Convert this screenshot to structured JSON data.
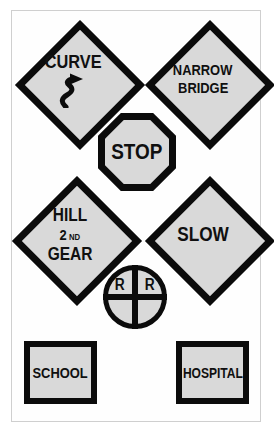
{
  "page": {
    "background_color": "#ffffff",
    "frame_color": "#cfcfcf"
  },
  "style": {
    "sign_face_color": "#d9d9d9",
    "sign_border_color": "#0b0b0b",
    "text_color": "#101010"
  },
  "signs": [
    {
      "id": "curve",
      "shape": "diamond",
      "lines": [
        "CURVE"
      ],
      "symbol": "curve-arrow-icon",
      "position": "top-left"
    },
    {
      "id": "narrow-bridge",
      "shape": "diamond",
      "lines": [
        "NARROW",
        "BRIDGE"
      ],
      "symbol": null,
      "position": "top-right"
    },
    {
      "id": "stop",
      "shape": "octagon",
      "lines": [
        "STOP"
      ],
      "symbol": null,
      "position": "upper-center"
    },
    {
      "id": "hill",
      "shape": "diamond",
      "lines": [
        "HILL",
        "2ND",
        "GEAR"
      ],
      "number": "2",
      "ordinal": "ND",
      "symbol": null,
      "position": "middle-left"
    },
    {
      "id": "slow",
      "shape": "diamond",
      "lines": [
        "SLOW"
      ],
      "symbol": null,
      "position": "middle-right"
    },
    {
      "id": "railroad-crossing",
      "shape": "circle-with-cross",
      "lines": [
        "R",
        "R"
      ],
      "left_letter": "R",
      "right_letter": "R",
      "symbol": "crossbuck-cross-icon",
      "position": "lower-center"
    },
    {
      "id": "school",
      "shape": "rectangle",
      "lines": [
        "SCHOOL"
      ],
      "symbol": null,
      "position": "bottom-left"
    },
    {
      "id": "hospital",
      "shape": "rectangle",
      "lines": [
        "HOSPITAL"
      ],
      "symbol": null,
      "position": "bottom-right"
    }
  ]
}
